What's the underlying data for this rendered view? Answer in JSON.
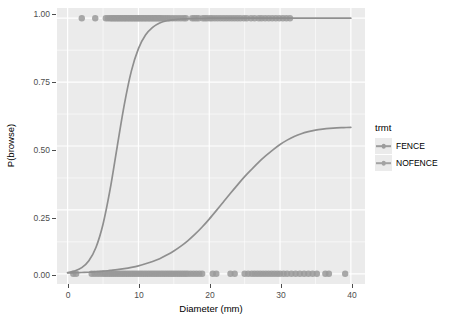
{
  "chart_data": {
    "type": "line",
    "title": "",
    "subtitle": "",
    "xlabel": "Diameter (mm)",
    "ylabel": "P(browse)",
    "xlim": [
      -1.5,
      42.0
    ],
    "ylim": [
      -0.04,
      1.04
    ],
    "xticks": [
      0,
      10,
      20,
      30,
      40
    ],
    "xtick_labels": [
      "0",
      "10",
      "20",
      "30",
      "40"
    ],
    "yticks": [
      0.0,
      0.25,
      0.5,
      0.75,
      1.0
    ],
    "ytick_labels": [
      "0.00",
      "0.25",
      "0.50",
      "0.75",
      "1.00"
    ],
    "grid": true,
    "grid_color": "#ffffff",
    "panel_background": "#ebebeb",
    "legend": {
      "title": "trmt",
      "position": "right",
      "entries": [
        {
          "name": "FENCE",
          "color": "#9c9c9c"
        },
        {
          "name": "NOFENCE",
          "color": "#a3a3a3"
        }
      ]
    },
    "series": [
      {
        "name": "FENCE",
        "type": "logistic-fit",
        "color": "#8f8f8f",
        "description": "Shallow logistic curve: near 0 until ~10 mm, rising slowly to about 0.57 at 40 mm",
        "x": [
          0,
          1,
          2,
          3,
          4,
          5,
          6,
          7,
          8,
          9,
          10,
          11,
          12,
          13,
          14,
          15,
          16,
          17,
          18,
          19,
          20,
          21,
          22,
          23,
          24,
          25,
          26,
          27,
          28,
          29,
          30,
          31,
          32,
          33,
          34,
          35,
          36,
          37,
          38,
          39,
          40
        ],
        "y": [
          0.003,
          0.004,
          0.005,
          0.006,
          0.008,
          0.01,
          0.013,
          0.016,
          0.02,
          0.025,
          0.031,
          0.039,
          0.048,
          0.059,
          0.073,
          0.089,
          0.108,
          0.13,
          0.155,
          0.183,
          0.214,
          0.247,
          0.281,
          0.315,
          0.348,
          0.38,
          0.409,
          0.437,
          0.462,
          0.485,
          0.506,
          0.523,
          0.537,
          0.548,
          0.556,
          0.562,
          0.566,
          0.569,
          0.571,
          0.572,
          0.573
        ]
      },
      {
        "name": "NOFENCE",
        "type": "logistic-fit",
        "color": "#8f8f8f",
        "description": "Steep logistic curve: rises from near 0 at 2 mm through 0.50 at about 8.6 mm to near 1.0 by 15 mm",
        "x": [
          0,
          1,
          2,
          3,
          4,
          5,
          6,
          7,
          8,
          9,
          10,
          11,
          12,
          13,
          14,
          15,
          16,
          17,
          18,
          19,
          20,
          22,
          25,
          30,
          35,
          40
        ],
        "y": [
          0.005,
          0.011,
          0.024,
          0.051,
          0.103,
          0.194,
          0.33,
          0.497,
          0.661,
          0.793,
          0.881,
          0.934,
          0.964,
          0.981,
          0.99,
          0.994,
          0.997,
          0.998,
          0.999,
          0.999,
          1.0,
          1.0,
          1.0,
          1.0,
          1.0,
          1.0
        ]
      }
    ],
    "scatter": {
      "color": "#9a9a9a",
      "marker": "circle",
      "size": 3.2,
      "description": "Observed binary browse outcomes jittered along y = 0 and y = 1",
      "points_y1": [
        2.0,
        3.9,
        5.4,
        5.7,
        6.0,
        6.2,
        6.4,
        6.6,
        6.8,
        7.0,
        7.2,
        7.4,
        7.6,
        7.8,
        8.0,
        8.2,
        8.4,
        8.6,
        8.8,
        9.0,
        9.2,
        9.4,
        9.6,
        9.8,
        10.0,
        10.2,
        10.4,
        10.6,
        10.8,
        11.0,
        11.2,
        11.4,
        11.6,
        11.8,
        12.0,
        12.2,
        12.4,
        12.6,
        12.8,
        13.0,
        13.2,
        13.5,
        13.8,
        14.1,
        14.4,
        14.8,
        15.2,
        15.6,
        16.0,
        16.4,
        16.7,
        17.6,
        17.9,
        18.2,
        18.5,
        19.1,
        19.4,
        19.7,
        20.1,
        20.4,
        20.8,
        21.2,
        21.6,
        22.0,
        22.4,
        22.8,
        23.2,
        23.6,
        24.0,
        24.4,
        24.9,
        25.3,
        25.9,
        26.4,
        27.0,
        27.4,
        27.9,
        28.4,
        28.9,
        29.4,
        29.9,
        30.4,
        30.9,
        31.4
      ],
      "points_y0": [
        0.8,
        1.2,
        3.4,
        3.8,
        4.2,
        4.6,
        5.0,
        5.3,
        5.6,
        5.9,
        6.2,
        6.5,
        6.8,
        7.1,
        7.4,
        7.7,
        8.0,
        8.3,
        8.6,
        8.9,
        9.2,
        9.5,
        9.8,
        10.1,
        10.4,
        10.7,
        11.0,
        11.3,
        11.6,
        11.9,
        12.2,
        12.5,
        12.8,
        13.1,
        13.4,
        13.7,
        14.0,
        14.3,
        14.6,
        14.9,
        15.2,
        15.5,
        15.8,
        16.1,
        16.4,
        16.7,
        17.0,
        17.4,
        17.8,
        18.2,
        18.6,
        19.0,
        20.5,
        21.0,
        23.0,
        23.6,
        25.0,
        25.5,
        26.0,
        26.4,
        26.8,
        27.2,
        27.6,
        28.0,
        28.4,
        28.8,
        29.2,
        29.6,
        30.0,
        30.5,
        31.0,
        31.6,
        32.2,
        32.8,
        33.4,
        34.0,
        34.6,
        35.2,
        36.4,
        36.9,
        39.2
      ]
    }
  },
  "axes": {
    "ylabel": "P(browse)",
    "xlabel": "Diameter (mm)",
    "ytick_labels": [
      "1.00",
      "0.75",
      "0.50",
      "0.25",
      "0.00"
    ],
    "xtick_labels": [
      "0",
      "10",
      "20",
      "30",
      "40"
    ]
  },
  "legend": {
    "title": "trmt",
    "items": [
      {
        "label": "FENCE",
        "color": "#9c9c9c"
      },
      {
        "label": "NOFENCE",
        "color": "#a3a3a3"
      }
    ]
  }
}
